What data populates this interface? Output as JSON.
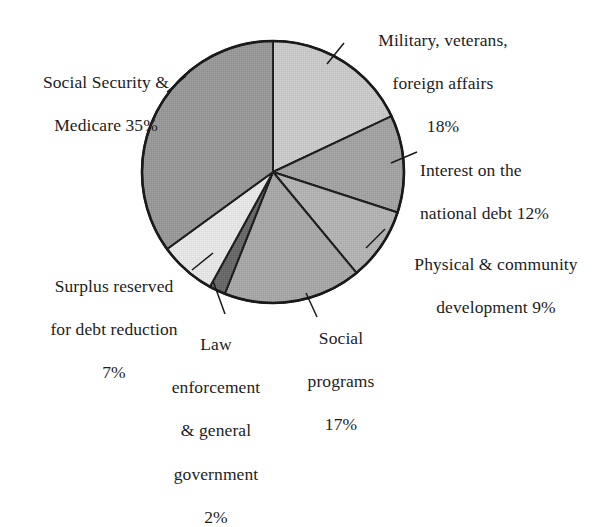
{
  "figure": {
    "name": "federal-budget-pie-chart",
    "background_color": "#ffffff",
    "outline_color": "#1a1a1a"
  },
  "chart_data": {
    "type": "pie",
    "title": "",
    "subtitle": "",
    "xlabel": "",
    "ylabel": "",
    "units": "percent",
    "total": 100,
    "legend_position": "none",
    "grid": false,
    "start_angle_deg": 0,
    "direction": "clockwise",
    "center": {
      "x": 273,
      "y": 172
    },
    "radius": 131,
    "categories": [
      "Military, veterans, foreign affairs",
      "Interest on the national debt",
      "Physical & community development",
      "Social programs",
      "Law enforcement & general government",
      "Surplus reserved for debt reduction",
      "Social Security & Medicare"
    ],
    "values": [
      18,
      12,
      9,
      17,
      2,
      7,
      35
    ],
    "colors": [
      "#c9c9c9",
      "#a1a1a1",
      "#b2b2b2",
      "#a6a6a6",
      "#666666",
      "#e6e6e6",
      "#979797"
    ],
    "slices": [
      {
        "key": "military",
        "label": "Military, veterans,\nforeign affairs",
        "percent_text": "18%",
        "value": 18,
        "color": "#c9c9c9",
        "start_deg": 0,
        "end_deg": 64.8
      },
      {
        "key": "interest",
        "label": "Interest on the\nnational debt",
        "percent_text": "12%",
        "value": 12,
        "color": "#a1a1a1",
        "start_deg": 64.8,
        "end_deg": 108
      },
      {
        "key": "physical",
        "label": "Physical & community\ndevelopment",
        "percent_text": "9%",
        "value": 9,
        "color": "#b2b2b2",
        "start_deg": 108,
        "end_deg": 140.4
      },
      {
        "key": "social-programs",
        "label": "Social\nprograms",
        "percent_text": "17%",
        "value": 17,
        "color": "#a6a6a6",
        "start_deg": 140.4,
        "end_deg": 201.6
      },
      {
        "key": "law-enforcement",
        "label": "Law\nenforcement\n& general\ngovernment",
        "percent_text": "2%",
        "value": 2,
        "color": "#666666",
        "start_deg": 201.6,
        "end_deg": 208.8
      },
      {
        "key": "surplus",
        "label": "Surplus reserved\nfor debt reduction",
        "percent_text": "7%",
        "value": 7,
        "color": "#e6e6e6",
        "start_deg": 208.8,
        "end_deg": 234
      },
      {
        "key": "social-security",
        "label": "Social Security &\nMedicare",
        "percent_text": "35%",
        "value": 35,
        "color": "#979797",
        "start_deg": 234,
        "end_deg": 360
      }
    ]
  },
  "labels": {
    "military": {
      "line1": "Military, veterans,",
      "line2": "foreign affairs",
      "line3": "18%"
    },
    "interest": {
      "line1": "Interest on the",
      "line2": "national debt  12%"
    },
    "physical": {
      "line1": "Physical & community",
      "line2": "development  9%"
    },
    "social_programs": {
      "line1": "Social",
      "line2": "programs",
      "line3": "17%"
    },
    "law": {
      "line1": "Law",
      "line2": "enforcement",
      "line3": "& general",
      "line4": "government",
      "line5": "2%"
    },
    "surplus": {
      "line1": "Surplus reserved",
      "line2": "for debt reduction",
      "line3": "7%"
    },
    "social_security": {
      "line1": "Social Security &",
      "line2": "Medicare  35%"
    }
  }
}
